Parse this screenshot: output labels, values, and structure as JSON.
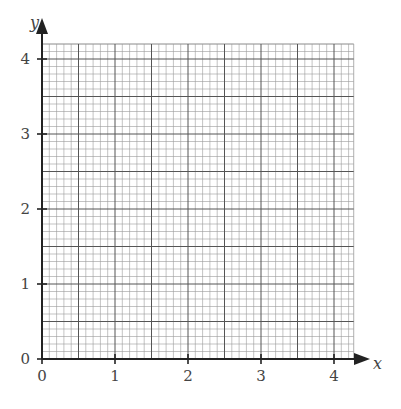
{
  "chart_data": {
    "type": "line",
    "title": "",
    "xlabel": "x",
    "ylabel": "y",
    "xlim": [
      0,
      4.27
    ],
    "ylim": [
      0,
      4.2
    ],
    "x_ticks": [
      0,
      1,
      2,
      3,
      4
    ],
    "y_ticks": [
      0,
      1,
      2,
      3,
      4
    ],
    "x_tick_labels": [
      "0",
      "1",
      "2",
      "3",
      "4"
    ],
    "y_tick_labels": [
      "0",
      "1",
      "2",
      "3",
      "4"
    ],
    "grid": true,
    "minor_divisions_per_unit": 10,
    "major_grid_every": 5,
    "series": [],
    "legend": null
  },
  "colors": {
    "axis": "#222222",
    "major_grid": "#555555",
    "minor_grid": "#9a9a9a",
    "text": "#444444"
  }
}
